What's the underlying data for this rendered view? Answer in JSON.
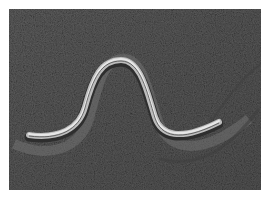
{
  "image": {
    "subject": "legless lizard / snake on sand",
    "description": "Black-and-white photograph of a striped slender reptile moving in an S-shaped curve across textured sand, leaving track marks",
    "colors": {
      "sand": "#5b5b5b",
      "sand_dark": "#3f3f3f",
      "sand_light": "#7a7a7a",
      "body_light": "#d8d8d8",
      "body_dark": "#2e2e2e",
      "background": "#ffffff"
    }
  }
}
